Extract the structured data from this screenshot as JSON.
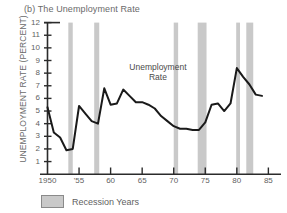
{
  "figure": {
    "title": "(b) The Unemployment Rate",
    "ylabel": "UNEMPLOYMENT RATE (PERCENT)",
    "annotation_line1": "Unemployment",
    "annotation_line2": "Rate",
    "legend_label": "Recession Years",
    "colors": {
      "line": "#1a1a1a",
      "axis": "#2b2b2b",
      "recession_band": "#c9c9c9",
      "text": "#5f5f5f",
      "background": "#ffffff"
    }
  },
  "chart_data": {
    "type": "line",
    "title": "(b) The Unemployment Rate",
    "xlabel": "",
    "ylabel": "UNEMPLOYMENT RATE (PERCENT)",
    "xlim": [
      1950,
      1987
    ],
    "ylim": [
      0,
      12
    ],
    "grid": false,
    "legend_position": "below-axis-left",
    "ytick_labels": [
      "12",
      "11",
      "10",
      "9",
      "8",
      "7",
      "6",
      "5",
      "4",
      "3",
      "2",
      "1"
    ],
    "ytick_values": [
      12,
      11,
      10,
      9,
      8,
      7,
      6,
      5,
      4,
      3,
      2,
      1
    ],
    "xtick_labels": [
      "1950",
      "'55",
      "60",
      "65",
      "70",
      "75",
      "80",
      "85"
    ],
    "xtick_values": [
      1950,
      1955,
      1960,
      1965,
      1970,
      1975,
      1980,
      1985
    ],
    "annotation": "Unemployment Rate",
    "series": [
      {
        "name": "Unemployment Rate",
        "x": [
          1950,
          1951,
          1952,
          1953,
          1954,
          1955,
          1956,
          1957,
          1958,
          1959,
          1960,
          1961,
          1962,
          1963,
          1964,
          1965,
          1966,
          1967,
          1968,
          1969,
          1970,
          1971,
          1972,
          1973,
          1974,
          1975,
          1976,
          1977,
          1978,
          1979,
          1980,
          1981,
          1982,
          1983,
          1984
        ],
        "values": [
          5.3,
          3.3,
          2.9,
          1.9,
          2.0,
          5.4,
          4.8,
          4.2,
          4.0,
          6.8,
          5.5,
          5.6,
          6.7,
          6.2,
          5.7,
          5.7,
          5.5,
          5.2,
          4.6,
          4.2,
          3.8,
          3.6,
          3.6,
          3.5,
          3.5,
          4.1,
          5.5,
          5.6,
          5.0,
          5.6,
          8.4,
          7.7,
          7.1,
          6.3,
          6.2
        ]
      }
    ],
    "recession_bands": [
      {
        "start": 1953.3,
        "end": 1954.0
      },
      {
        "start": 1957.4,
        "end": 1958.2
      },
      {
        "start": 1970.0,
        "end": 1970.7
      },
      {
        "start": 1973.8,
        "end": 1975.2
      },
      {
        "start": 1979.9,
        "end": 1980.5
      },
      {
        "start": 1981.5,
        "end": 1982.6
      }
    ]
  }
}
